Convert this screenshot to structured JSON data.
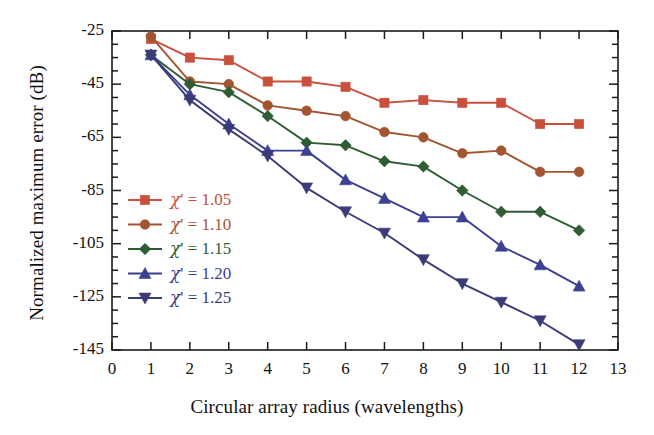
{
  "chart_data": {
    "type": "line",
    "title": "",
    "xlabel": "Circular array radius (wavelengths)",
    "ylabel": "Normalized maximum error (dB)",
    "xlim": [
      0,
      13
    ],
    "ylim": [
      -145,
      -25
    ],
    "xticks": [
      0,
      1,
      2,
      3,
      4,
      5,
      6,
      7,
      8,
      9,
      10,
      11,
      12,
      13
    ],
    "yticks": [
      -25,
      -45,
      -65,
      -85,
      -105,
      -125,
      -145
    ],
    "xtick_labels": [
      "0",
      "1",
      "2",
      "3",
      "4",
      "5",
      "6",
      "7",
      "8",
      "9",
      "10",
      "11",
      "12",
      "13"
    ],
    "ytick_labels": [
      "-25",
      "-45",
      "-65",
      "-85",
      "-105",
      "-125",
      "-145"
    ],
    "minor_tick_interval_y": 5,
    "grid": false,
    "legend_position": "lower-left-inside",
    "x": [
      1,
      2,
      3,
      4,
      5,
      6,
      7,
      8,
      9,
      10,
      11,
      12
    ],
    "series": [
      {
        "name": "χ' = 1.05",
        "chi_value": "1.05",
        "marker": "square",
        "color": "#c8503c",
        "values": [
          -28,
          -35,
          -36,
          -44,
          -44,
          -46,
          -52,
          -51,
          -52,
          -52,
          -60,
          -60
        ]
      },
      {
        "name": "χ' = 1.10",
        "chi_value": "1.10",
        "marker": "circle",
        "color": "#a35432",
        "values": [
          -27,
          -44,
          -45,
          -53,
          -55,
          -57,
          -63,
          -65,
          -71,
          -70,
          -78,
          -78
        ]
      },
      {
        "name": "χ' = 1.15",
        "chi_value": "1.15",
        "marker": "diamond",
        "color": "#2f5d33",
        "values": [
          -34,
          -45,
          -48,
          -57,
          -67,
          -68,
          -74,
          -76,
          -85,
          -93,
          -93,
          -100
        ]
      },
      {
        "name": "χ' = 1.20",
        "chi_value": "1.20",
        "marker": "triangle-up",
        "color": "#3b4190",
        "values": [
          -34,
          -49,
          -60,
          -70,
          -70,
          -81,
          -88,
          -95,
          -95,
          -106,
          -113,
          -121
        ]
      },
      {
        "name": "χ' = 1.25",
        "chi_value": "1.25",
        "marker": "triangle-down",
        "color": "#3b3b78",
        "values": [
          -34,
          -51,
          -62,
          -72,
          -84,
          -93,
          -101,
          -111,
          -120,
          -127,
          -134,
          -143
        ]
      }
    ]
  },
  "legend": {
    "entries": [
      {
        "symbol": "χ",
        "prime_eq": "' = 1.05"
      },
      {
        "symbol": "χ",
        "prime_eq": "' = 1.10"
      },
      {
        "symbol": "χ",
        "prime_eq": "' = 1.15"
      },
      {
        "symbol": "χ",
        "prime_eq": "' = 1.20"
      },
      {
        "symbol": "χ",
        "prime_eq": "' = 1.25"
      }
    ]
  },
  "axes": {
    "x_title": "Circular array radius (wavelengths)",
    "y_title": "Normalized maximum error (dB)"
  }
}
